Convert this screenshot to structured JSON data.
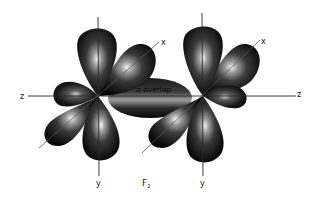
{
  "figure": {
    "molecule_label": "F",
    "molecule_subscript": "2",
    "overlap_label": "σ overlap",
    "atoms": [
      {
        "name": "left-fluorine",
        "axis_labels": {
          "z": "z",
          "x": "x",
          "y": "y"
        }
      },
      {
        "name": "right-fluorine",
        "axis_labels": {
          "z": "z",
          "x": "x",
          "y": "y"
        }
      }
    ],
    "colors": {
      "lobe_dark": "#0d0d0d",
      "lobe_mid": "#3a3a3a",
      "lobe_highlight": "#f2f2f2",
      "axis": "#2a2a2a",
      "background": "#ffffff"
    }
  }
}
